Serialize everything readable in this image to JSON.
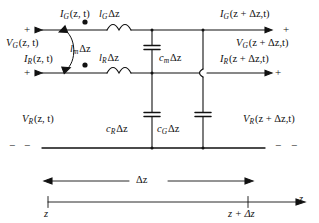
{
  "figure": {
    "kind": "transmission-line-equivalent-circuit",
    "title": ""
  },
  "labels": {
    "i_g_left": {
      "sym": "I",
      "sub": "G",
      "arg": "(z, t)"
    },
    "v_g_left": {
      "sym": "V",
      "sub": "G",
      "arg": "(z, t)"
    },
    "i_r_left": {
      "sym": "I",
      "sub": "R",
      "arg": "(z, t)"
    },
    "v_r_left": {
      "sym": "V",
      "sub": "R",
      "arg": "(z, t)"
    },
    "i_g_right": {
      "sym": "I",
      "sub": "G",
      "arg": "(z + Δz,t)"
    },
    "v_g_right": {
      "sym": "V",
      "sub": "G",
      "arg": "(z + Δz,t)"
    },
    "i_r_right": {
      "sym": "I",
      "sub": "R",
      "arg": "(z + Δz,t)"
    },
    "v_r_right": {
      "sym": "V",
      "sub": "R",
      "arg": "(z + Δz,t)"
    },
    "l_g": {
      "sym": "l",
      "sub": "G",
      "arg": "Δz"
    },
    "l_r": {
      "sym": "l",
      "sub": "R",
      "arg": "Δz"
    },
    "l_m": {
      "sym": "l",
      "sub": "m",
      "arg": "Δz"
    },
    "c_m": {
      "sym": "c",
      "sub": "m",
      "arg": "Δz"
    },
    "c_r": {
      "sym": "c",
      "sub": "R",
      "arg": "Δz"
    },
    "c_g": {
      "sym": "c",
      "sub": "G",
      "arg": "Δz"
    },
    "delta_z": "Δz",
    "z_left": "z",
    "z_right": "z + Δz",
    "z_axis": "z"
  },
  "polarity": {
    "plus": "+",
    "minus": "−",
    "top_left_plus": "+",
    "mid_left_plus": "+",
    "top_right_plus": "+",
    "mid_right_plus": "+",
    "bottom_left_minus_1": "−",
    "bottom_left_minus_2": "−",
    "bottom_right_minus_1": "−",
    "bottom_right_minus_2": "−"
  },
  "colors": {
    "ink": "#111111",
    "background": "#ffffff"
  },
  "geometry": {
    "top_rail_y": 30,
    "mid_rail_y": 73,
    "bottom_rail_y": 148,
    "left_x": 42,
    "right_x": 265,
    "cm_column_x": 152,
    "cg_column_x": 203
  }
}
